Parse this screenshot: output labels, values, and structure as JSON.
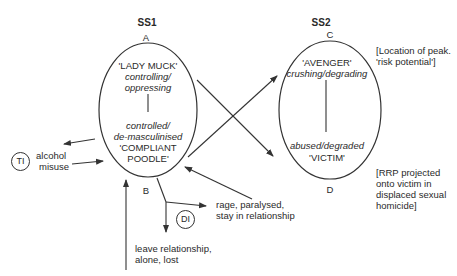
{
  "colors": {
    "line": "#333333",
    "text": "#2a2a2a",
    "background": "#ffffff"
  },
  "states": [
    {
      "id": "SS1",
      "title": "SS1",
      "top_point": "A",
      "bottom_point": "B",
      "upper_role": "'LADY MUCK'",
      "upper_desc_line1": "controlling/",
      "upper_desc_line2": "oppressing",
      "lower_desc_line1": "controlled/",
      "lower_desc_line2": "de-masculinised",
      "lower_role_line1": "'COMPLIANT",
      "lower_role_line2": "POODLE'"
    },
    {
      "id": "SS2",
      "title": "SS2",
      "top_point": "C",
      "bottom_point": "D",
      "upper_role": "'AVENGER'",
      "upper_desc": "crushing/degrading",
      "lower_desc": "abused/degraded",
      "lower_role": "'VICTIM'"
    }
  ],
  "annotations": {
    "peak_line1": "[Location of peak.",
    "peak_line2": "'risk potential']",
    "rrp_line1": "[RRP projected",
    "rrp_line2": "onto victim in",
    "rrp_line3": "displaced sexual",
    "rrp_line4": "homicide]"
  },
  "nodes": {
    "t1": "TI",
    "d1": "DI"
  },
  "labels": {
    "alcohol_line1": "alcohol",
    "alcohol_line2": "misuse",
    "rage_line1": "rage, paralysed,",
    "rage_line2": "stay in relationship",
    "leave_line1": "leave relationship,",
    "leave_line2": "alone, lost"
  }
}
